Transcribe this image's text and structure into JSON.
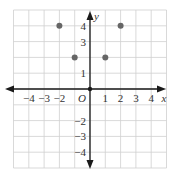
{
  "chart_data": {
    "type": "scatter",
    "title": "",
    "xlabel": "x",
    "ylabel": "y",
    "origin_label": "O",
    "xlim": [
      -5,
      5
    ],
    "ylim": [
      -5,
      5
    ],
    "grid": true,
    "legend": null,
    "x_tick_labels": [
      {
        "value": -4,
        "label": "−4"
      },
      {
        "value": -3,
        "label": "−3"
      },
      {
        "value": -2,
        "label": "−2"
      },
      {
        "value": 1,
        "label": "1"
      },
      {
        "value": 2,
        "label": "2"
      },
      {
        "value": 3,
        "label": "3"
      },
      {
        "value": 4,
        "label": "4"
      }
    ],
    "y_tick_labels": [
      {
        "value": 4,
        "label": "4"
      },
      {
        "value": 3,
        "label": "3"
      },
      {
        "value": 1,
        "label": "1"
      },
      {
        "value": -2,
        "label": "−2"
      },
      {
        "value": -3,
        "label": "−3"
      },
      {
        "value": -4,
        "label": "−4"
      }
    ],
    "series": [
      {
        "name": "points",
        "points": [
          {
            "x": -2,
            "y": 4
          },
          {
            "x": -1,
            "y": 2
          },
          {
            "x": 1,
            "y": 2
          },
          {
            "x": 2,
            "y": 4
          }
        ]
      }
    ]
  },
  "colors": {
    "grid": "#cfcfcf",
    "axis": "#1a1a1a",
    "point": "#666666",
    "label": "#333333"
  }
}
